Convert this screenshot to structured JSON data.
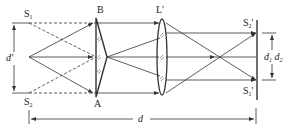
{
  "diagram": {
    "type": "optics-ray-diagram",
    "labels": {
      "S1": "S",
      "S1_sub": "1",
      "S2": "S",
      "S2_sub": "2",
      "B": "B",
      "A": "A",
      "d_prime": "d'",
      "lens": "L'",
      "S2_image": "S",
      "S2_image_sub": "2",
      "S2_image_prime": "'",
      "S1_image": "S",
      "S1_image_sub": "1",
      "S1_image_prime": "'",
      "d1": "d",
      "d1_sub": "1",
      "d2": "d",
      "d2_sub": "2",
      "d": "d"
    },
    "components": [
      "point source",
      "biprism AB",
      "virtual sources S1 S2",
      "lens L'",
      "screen",
      "images S1' S2'"
    ],
    "colors": {
      "line": "#333333",
      "background": "#ffffff"
    }
  }
}
